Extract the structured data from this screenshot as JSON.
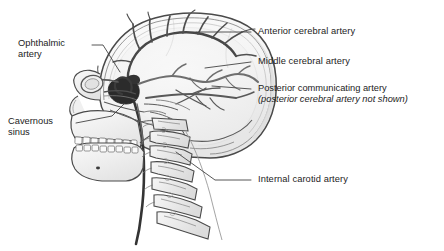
{
  "figure": {
    "background_color": "#ffffff",
    "line_color": "#3a3a3a",
    "leader_color": "#444444",
    "bone_fill": "#f2f2f2",
    "bone_shade": "#e0e0e0",
    "brain_fill": "#f7f7f7",
    "artery_color": "#4a4a4a",
    "artery_dark": "#2e2e2e",
    "cavernous_sinus_fill": "#2b2b2b",
    "text_color": "#1c1c1c"
  },
  "labels": {
    "ophthalmic_artery": {
      "line_1": "Ophthalmic",
      "line_2": "artery"
    },
    "cavernous_sinus": {
      "line_1": "Cavernous",
      "line_2": "sinus"
    },
    "anterior_cerebral_artery": "Anterior cerebral artery",
    "middle_cerebral_artery": "Middle cerebral artery",
    "posterior_communicating_artery": {
      "line_1": "Posterior communicating artery",
      "line_2": "(posterior cerebral artery not shown)"
    },
    "internal_carotid_artery": "Internal carotid artery"
  },
  "anatomy": {
    "structures": [
      "cranial vault",
      "facial skeleton",
      "mandible",
      "maxillary teeth",
      "mandibular teeth",
      "orbit",
      "nasal cavity",
      "cervical vertebrae",
      "anterior cerebral artery",
      "middle cerebral artery",
      "posterior communicating artery",
      "internal carotid artery",
      "ophthalmic artery",
      "cavernous sinus"
    ],
    "vertebrae_count": 7,
    "view": "left lateral"
  }
}
